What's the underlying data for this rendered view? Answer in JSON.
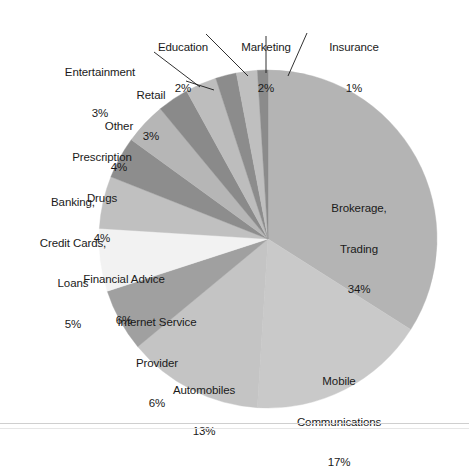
{
  "chart_data": {
    "type": "pie",
    "title": "",
    "subtitle": "",
    "xlabel": "",
    "ylabel": "",
    "legend_position": "none",
    "labels_position": "outside-with-leader-lines",
    "units": "percent",
    "total": 100,
    "start_angle_deg": 0,
    "direction": "clockwise",
    "categories": [
      "Brokerage, Trading",
      "Mobile Communications",
      "Automobiles",
      "Internet Service Provider",
      "Financial Advice",
      "Banking, Credit Cards, Loans",
      "Prescription Drugs",
      "Other",
      "Retail",
      "Entertainment",
      "Education",
      "Marketing",
      "Insurance"
    ],
    "values": [
      34,
      17,
      13,
      6,
      6,
      5,
      4,
      4,
      3,
      3,
      2,
      2,
      1
    ],
    "colors": [
      "#b4b4b4",
      "#c9c9c9",
      "#c4c4c4",
      "#a0a0a0",
      "#f2f2f2",
      "#c0c0c0",
      "#8d8d8d",
      "#b6b6b6",
      "#8a8a8a",
      "#bdbdbd",
      "#8c8c8c",
      "#bfbfbf",
      "#8b8b8b"
    ],
    "slices": [
      {
        "label": "Brokerage,\nTrading",
        "label_line1": "Brokerage,",
        "label_line2": "Trading",
        "value_text": "34%",
        "value": 34,
        "color": "#b4b4b4"
      },
      {
        "label": "Mobile\nCommunications",
        "label_line1": "Mobile",
        "label_line2": "Communications",
        "value_text": "17%",
        "value": 17,
        "color": "#c9c9c9"
      },
      {
        "label": "Automobiles",
        "label_line1": "Automobiles",
        "label_line2": "",
        "value_text": "13%",
        "value": 13,
        "color": "#c4c4c4"
      },
      {
        "label": "Internet Service\nProvider",
        "label_line1": "Internet Service",
        "label_line2": "Provider",
        "value_text": "6%",
        "value": 6,
        "color": "#a0a0a0"
      },
      {
        "label": "Financial Advice",
        "label_line1": "Financial Advice",
        "label_line2": "",
        "value_text": "6%",
        "value": 6,
        "color": "#f2f2f2"
      },
      {
        "label": "Banking,\nCredit Cards,\nLoans",
        "label_line1": "Banking,",
        "label_line2": "Credit Cards,",
        "label_line3": "Loans",
        "value_text": "5%",
        "value": 5,
        "color": "#c0c0c0"
      },
      {
        "label": "Prescription\nDrugs",
        "label_line1": "Prescription",
        "label_line2": "Drugs",
        "value_text": "4%",
        "value": 4,
        "color": "#8d8d8d"
      },
      {
        "label": "Other",
        "label_line1": "Other",
        "label_line2": "",
        "value_text": "4%",
        "value": 4,
        "color": "#b6b6b6"
      },
      {
        "label": "Retail",
        "label_line1": "Retail",
        "label_line2": "",
        "value_text": "3%",
        "value": 3,
        "color": "#8a8a8a"
      },
      {
        "label": "Entertainment",
        "label_line1": "Entertainment",
        "label_line2": "",
        "value_text": "3%",
        "value": 3,
        "color": "#bdbdbd"
      },
      {
        "label": "Education",
        "label_line1": "Education",
        "label_line2": "",
        "value_text": "2%",
        "value": 2,
        "color": "#8c8c8c"
      },
      {
        "label": "Marketing",
        "label_line1": "Marketing",
        "label_line2": "",
        "value_text": "2%",
        "value": 2,
        "color": "#bfbfbf"
      },
      {
        "label": "Insurance",
        "label_line1": "Insurance",
        "label_line2": "",
        "value_text": "1%",
        "value": 1,
        "color": "#8b8b8b"
      }
    ]
  },
  "labels": {
    "education": {
      "name": "Education",
      "value": "2%"
    },
    "marketing": {
      "name": "Marketing",
      "value": "2%"
    },
    "insurance": {
      "name": "Insurance",
      "value": "1%"
    },
    "entertainment": {
      "name": "Entertainment",
      "value": "3%"
    },
    "retail": {
      "name": "Retail",
      "value": "3%"
    },
    "other": {
      "name": "Other",
      "value": "4%"
    },
    "prescription_l1": {
      "name": "Prescription",
      "value": "4%"
    },
    "prescription_l2": {
      "name": "Drugs"
    },
    "banking_l1": {
      "name": "Banking,",
      "value": "5%"
    },
    "banking_l2": {
      "name": "Credit Cards,"
    },
    "banking_l3": {
      "name": "Loans"
    },
    "financial_advice": {
      "name": "Financial Advice",
      "value": "6%"
    },
    "isp_l1": {
      "name": "Internet Service",
      "value": "6%"
    },
    "isp_l2": {
      "name": "Provider"
    },
    "automobiles": {
      "name": "Automobiles",
      "value": "13%"
    },
    "mobile_l1": {
      "name": "Mobile",
      "value": "17%"
    },
    "mobile_l2": {
      "name": "Communications"
    },
    "brokerage_l1": {
      "name": "Brokerage,",
      "value": "34%"
    },
    "brokerage_l2": {
      "name": "Trading"
    }
  }
}
